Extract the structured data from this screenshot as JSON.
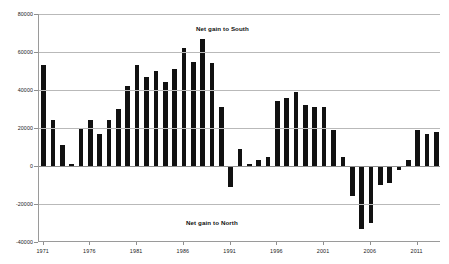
{
  "chart_data": {
    "type": "bar",
    "title": "",
    "subtitle": "",
    "xlabel": "",
    "ylabel": "",
    "ylim": [
      -40000,
      80000
    ],
    "ytick_labels": [
      "80000",
      "60000",
      "40000",
      "20000",
      "0",
      "-20000",
      "-40000"
    ],
    "ytick_values": [
      80000,
      60000,
      40000,
      20000,
      0,
      -20000,
      -40000
    ],
    "xtick_labels": [
      "1971",
      "1976",
      "1981",
      "1986",
      "1991",
      "1996",
      "2001",
      "2006",
      "2011"
    ],
    "xtick_values": [
      1971,
      1976,
      1981,
      1986,
      1991,
      1996,
      2001,
      2006,
      2011
    ],
    "grid": true,
    "legend": "none",
    "bar_color": "#111111",
    "annotations": [
      {
        "text": "Net gain to South",
        "x": 1984,
        "y": 72000
      },
      {
        "text": "Net gain to North",
        "x": 1982,
        "y": -28000
      }
    ],
    "categories": [
      1971,
      1972,
      1973,
      1974,
      1975,
      1976,
      1977,
      1978,
      1979,
      1980,
      1981,
      1982,
      1983,
      1984,
      1985,
      1986,
      1987,
      1988,
      1989,
      1990,
      1991,
      1992,
      1993,
      1994,
      1995,
      1996,
      1997,
      1998,
      1999,
      2000,
      2001,
      2002,
      2003,
      2004,
      2005,
      2006,
      2007,
      2008,
      2009,
      2010,
      2011,
      2012,
      2013
    ],
    "values": [
      53000,
      24000,
      11000,
      1000,
      20000,
      24000,
      17000,
      24000,
      30000,
      42000,
      53000,
      47000,
      50000,
      44000,
      51000,
      62000,
      55000,
      67000,
      54000,
      31000,
      -11000,
      9000,
      1000,
      3000,
      5000,
      34000,
      36000,
      39000,
      32000,
      31000,
      31000,
      19000,
      5000,
      -16000,
      -33000,
      -30000,
      -10000,
      -9000,
      -2000,
      3000,
      19000,
      17000,
      18000
    ]
  }
}
